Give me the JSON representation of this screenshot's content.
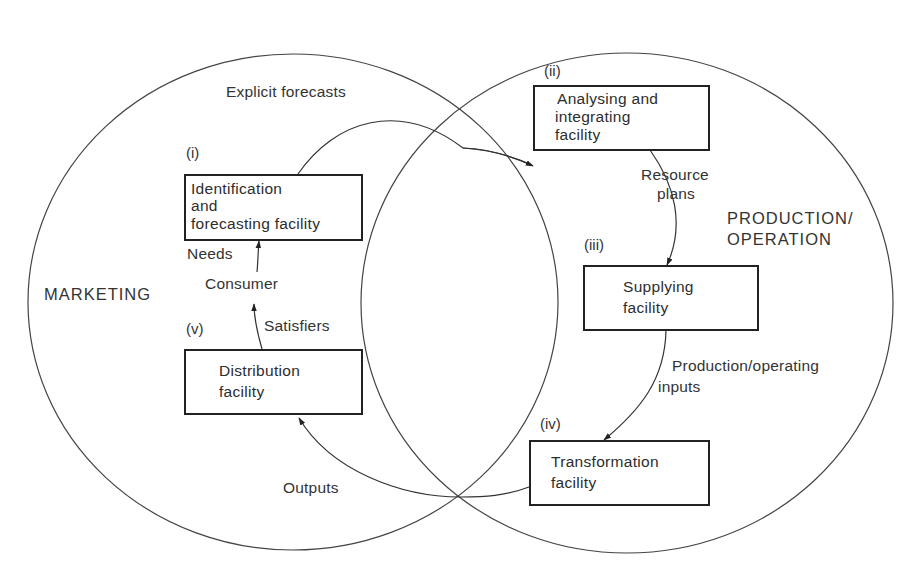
{
  "diagram": {
    "type": "venn-flow",
    "regions": {
      "left": "MARKETING",
      "right_line1": "PRODUCTION/",
      "right_line2": "OPERATION"
    },
    "facilities": [
      {
        "numeral": "(i)",
        "lines": [
          "Identification",
          "and",
          "forecasting facility"
        ]
      },
      {
        "numeral": "(ii)",
        "lines": [
          "Analysing and",
          "integrating",
          "facility"
        ]
      },
      {
        "numeral": "(iii)",
        "lines": [
          "Supplying",
          "facility"
        ]
      },
      {
        "numeral": "(iv)",
        "lines": [
          "Transformation",
          "facility"
        ]
      },
      {
        "numeral": "(v)",
        "lines": [
          "Distribution",
          "facility"
        ]
      }
    ],
    "flows": {
      "explicit_forecasts": "Explicit forecasts",
      "resource_plans_1": "Resource",
      "resource_plans_2": "plans",
      "production_inputs_1": "Production/operating",
      "production_inputs_2": "inputs",
      "outputs": "Outputs",
      "satisfiers": "Satisfiers",
      "consumer": "Consumer",
      "needs": "Needs"
    },
    "colors": {
      "line": "#333333",
      "box_border": "#222222",
      "background": "#ffffff"
    }
  }
}
